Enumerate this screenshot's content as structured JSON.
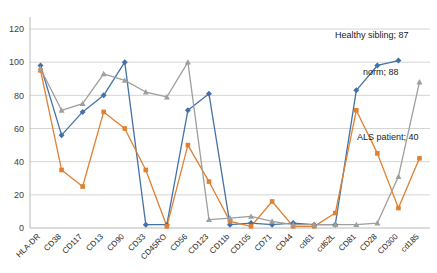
{
  "chart_data": {
    "type": "line",
    "title": "",
    "xlabel": "",
    "ylabel": "",
    "ylim": [
      0,
      120
    ],
    "ytick_step": 20,
    "yticks": [
      "0",
      "20",
      "40",
      "60",
      "80",
      "100",
      "120"
    ],
    "grid": true,
    "legend_position": "inline-right-annotations",
    "categories": [
      "HLA-DR",
      "CD38",
      "CD117",
      "CD13",
      "CD90",
      "CD33",
      "CD45RO",
      "CD56",
      "CD123",
      "CD11b",
      "CD105",
      "CD71",
      "CD44",
      "cd61",
      "cd62L",
      "CD81",
      "CD28",
      "CD300",
      "cd185"
    ],
    "series": [
      {
        "name": "Healthy sibling",
        "color": "#4472a8",
        "marker": "diamond",
        "end_label": "Healthy sibling; 87",
        "end_value": 87,
        "values": [
          98,
          56,
          70,
          80,
          100,
          2,
          2,
          71,
          81,
          2,
          3,
          2,
          3,
          2,
          2,
          83,
          98,
          101,
          null
        ]
      },
      {
        "name": "ALS patient",
        "color": "#e08030",
        "marker": "square",
        "end_label": "ALS patient; 40",
        "end_value": 40,
        "values": [
          95,
          35,
          25,
          70,
          60,
          35,
          1,
          50,
          28,
          4,
          1,
          16,
          1,
          1,
          9,
          71,
          45,
          12,
          42
        ]
      },
      {
        "name": "norm",
        "color": "#9e9e9e",
        "marker": "triangle",
        "end_label": "norm; 88",
        "end_value": 88,
        "values": [
          96,
          71,
          75,
          93,
          89,
          82,
          79,
          100,
          5,
          6,
          7,
          4,
          2,
          2,
          2,
          2,
          3,
          31,
          88
        ]
      }
    ],
    "annotations": [
      {
        "text": "Healthy sibling; 87",
        "x": 335,
        "y": 38
      },
      {
        "text": "norm; 88",
        "x": 363,
        "y": 75
      },
      {
        "text": "ALS patient; 40",
        "x": 357,
        "y": 140
      }
    ]
  },
  "colors": {
    "series_blue": "#4472a8",
    "series_orange": "#e08030",
    "series_gray": "#9e9e9e",
    "gridline": "#c9c9c9",
    "background": "#ffffff",
    "tick_text": "#404040"
  }
}
